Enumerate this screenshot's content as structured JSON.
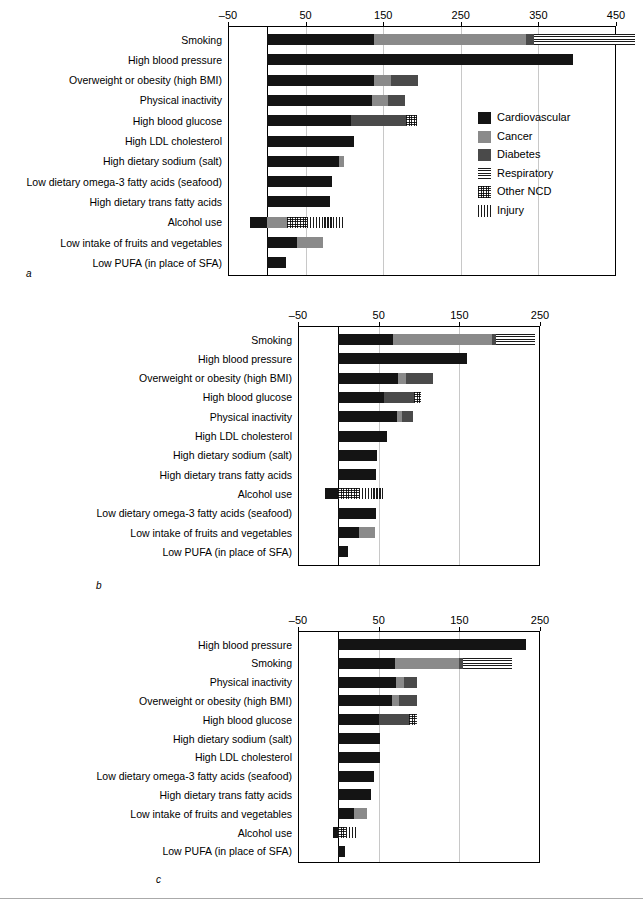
{
  "legend": {
    "items": [
      {
        "label": "Cardiovascular",
        "key": "cardio",
        "color": "#141414"
      },
      {
        "label": "Cancer",
        "key": "cancer",
        "color": "#8a8a8a"
      },
      {
        "label": "Diabetes",
        "key": "diabetes",
        "color": "#4a4a4a"
      },
      {
        "label": "Respiratory",
        "key": "respiratory",
        "color": "#1a1a1a"
      },
      {
        "label": "Other NCD",
        "key": "other_ncd",
        "color": "#2a2a2a"
      },
      {
        "label": "Injury",
        "key": "injury",
        "color": "#1a1a1a"
      }
    ]
  },
  "panels": [
    {
      "letter": "a"
    },
    {
      "letter": "b"
    },
    {
      "letter": "c"
    }
  ],
  "chart_data": [
    {
      "type": "bar",
      "orientation": "horizontal",
      "stacked": true,
      "panel": "a",
      "title": "",
      "xlabel": "",
      "ylabel": "",
      "xlim": [
        -50,
        450
      ],
      "xticks": [
        -50,
        50,
        150,
        250,
        350,
        450
      ],
      "xticklabels": [
        "–50",
        "50",
        "150",
        "250",
        "350",
        "450"
      ],
      "grid": "vertical",
      "legend_position": "inside-right",
      "series": [
        "Cardiovascular",
        "Cancer",
        "Diabetes",
        "Respiratory",
        "Other NCD",
        "Injury"
      ],
      "categories": [
        "Smoking",
        "High blood pressure",
        "Overweight or obesity (high BMI)",
        "Physical inactivity",
        "High blood glucose",
        "High LDL cholesterol",
        "High dietary sodium (salt)",
        "Low dietary omega-3 fatty acids (seafood)",
        "High dietary trans fatty acids",
        "Alcohol use",
        "Low intake of fruits and vegetables",
        "Low PUFA (in place of SFA)"
      ],
      "values": [
        {
          "cardio": 138,
          "cancer": 196,
          "diabetes": 10,
          "respiratory": 131,
          "other_ncd": 0,
          "injury": 0
        },
        {
          "cardio": 395,
          "cancer": 0,
          "diabetes": 0,
          "respiratory": 0,
          "other_ncd": 0,
          "injury": 0
        },
        {
          "cardio": 138,
          "cancer": 22,
          "diabetes": 35,
          "respiratory": 0,
          "other_ncd": 0,
          "injury": 0
        },
        {
          "cardio": 136,
          "cancer": 20,
          "diabetes": 22,
          "respiratory": 0,
          "other_ncd": 0,
          "injury": 0
        },
        {
          "cardio": 108,
          "cancer": 0,
          "diabetes": 72,
          "respiratory": 0,
          "other_ncd": 14,
          "injury": 0
        },
        {
          "cardio": 112,
          "cancer": 0,
          "diabetes": 0,
          "respiratory": 0,
          "other_ncd": 0,
          "injury": 0
        },
        {
          "cardio": 93,
          "cancer": 6,
          "diabetes": 0,
          "respiratory": 0,
          "other_ncd": 0,
          "injury": 0
        },
        {
          "cardio": 84,
          "cancer": 0,
          "diabetes": 0,
          "respiratory": 0,
          "other_ncd": 0,
          "injury": 0
        },
        {
          "cardio": 82,
          "cancer": 0,
          "diabetes": 0,
          "respiratory": 0,
          "other_ncd": 0,
          "injury": 0
        },
        {
          "cardio": -22,
          "cancer": 26,
          "diabetes": 0,
          "respiratory": 0,
          "other_ncd": 26,
          "injury": 48
        },
        {
          "cardio": 39,
          "cancer": 33,
          "diabetes": 0,
          "respiratory": 0,
          "other_ncd": 0,
          "injury": 0
        },
        {
          "cardio": 25,
          "cancer": 0,
          "diabetes": 0,
          "respiratory": 0,
          "other_ncd": 0,
          "injury": 0
        }
      ]
    },
    {
      "type": "bar",
      "orientation": "horizontal",
      "stacked": true,
      "panel": "b",
      "title": "",
      "xlabel": "",
      "ylabel": "",
      "xlim": [
        -50,
        250
      ],
      "xticks": [
        -50,
        50,
        150,
        250
      ],
      "xticklabels": [
        "–50",
        "50",
        "150",
        "250"
      ],
      "grid": "vertical",
      "legend_position": "none",
      "series": [
        "Cardiovascular",
        "Cancer",
        "Diabetes",
        "Respiratory",
        "Other NCD",
        "Injury"
      ],
      "categories": [
        "Smoking",
        "High blood pressure",
        "Overweight or obesity (high BMI)",
        "High blood glucose",
        "Physical inactivity",
        "High LDL cholesterol",
        "High dietary sodium (salt)",
        "High dietary trans fatty acids",
        "Alcohol use",
        "Low dietary omega-3 fatty acids (seafood)",
        "Low intake of fruits and vegetables",
        "Low PUFA (in place of SFA)"
      ],
      "values": [
        {
          "cardio": 68,
          "cancer": 122,
          "diabetes": 6,
          "respiratory": 48,
          "other_ncd": 0,
          "injury": 0
        },
        {
          "cardio": 160,
          "cancer": 0,
          "diabetes": 0,
          "respiratory": 0,
          "other_ncd": 0,
          "injury": 0
        },
        {
          "cardio": 74,
          "cancer": 10,
          "diabetes": 33,
          "respiratory": 0,
          "other_ncd": 0,
          "injury": 0
        },
        {
          "cardio": 57,
          "cancer": 0,
          "diabetes": 37,
          "respiratory": 0,
          "other_ncd": 8,
          "injury": 0
        },
        {
          "cardio": 73,
          "cancer": 6,
          "diabetes": 14,
          "respiratory": 0,
          "other_ncd": 0,
          "injury": 0
        },
        {
          "cardio": 60,
          "cancer": 0,
          "diabetes": 0,
          "respiratory": 0,
          "other_ncd": 0,
          "injury": 0
        },
        {
          "cardio": 48,
          "cancer": 0,
          "diabetes": 0,
          "respiratory": 0,
          "other_ncd": 0,
          "injury": 0
        },
        {
          "cardio": 47,
          "cancer": 0,
          "diabetes": 0,
          "respiratory": 0,
          "other_ncd": 0,
          "injury": 0
        },
        {
          "cardio": -16,
          "cancer": 0,
          "diabetes": 0,
          "respiratory": 0,
          "other_ncd": 26,
          "injury": 30
        },
        {
          "cardio": 47,
          "cancer": 0,
          "diabetes": 0,
          "respiratory": 0,
          "other_ncd": 0,
          "injury": 0
        },
        {
          "cardio": 26,
          "cancer": 19,
          "diabetes": 0,
          "respiratory": 0,
          "other_ncd": 0,
          "injury": 0
        },
        {
          "cardio": 12,
          "cancer": 0,
          "diabetes": 0,
          "respiratory": 0,
          "other_ncd": 0,
          "injury": 0
        }
      ]
    },
    {
      "type": "bar",
      "orientation": "horizontal",
      "stacked": true,
      "panel": "c",
      "title": "",
      "xlabel": "",
      "ylabel": "",
      "xlim": [
        -50,
        250
      ],
      "xticks": [
        -50,
        50,
        150,
        250
      ],
      "xticklabels": [
        "–50",
        "50",
        "150",
        "250"
      ],
      "grid": "vertical",
      "legend_position": "none",
      "series": [
        "Cardiovascular",
        "Cancer",
        "Diabetes",
        "Respiratory",
        "Other NCD",
        "Injury"
      ],
      "categories": [
        "High blood pressure",
        "Smoking",
        "Physical inactivity",
        "Overweight or obesity (high BMI)",
        "High blood glucose",
        "High dietary sodium (salt)",
        "High LDL cholesterol",
        "Low dietary omega-3 fatty acids (seafood)",
        "High dietary trans fatty acids",
        "Low intake of fruits and vegetables",
        "Alcohol use",
        "Low PUFA (in place of SFA)"
      ],
      "values": [
        {
          "cardio": 233,
          "cancer": 0,
          "diabetes": 0,
          "respiratory": 0,
          "other_ncd": 0,
          "injury": 0
        },
        {
          "cardio": 70,
          "cancer": 80,
          "diabetes": 5,
          "respiratory": 60,
          "other_ncd": 0,
          "injury": 0
        },
        {
          "cardio": 72,
          "cancer": 10,
          "diabetes": 16,
          "respiratory": 0,
          "other_ncd": 0,
          "injury": 0
        },
        {
          "cardio": 66,
          "cancer": 9,
          "diabetes": 23,
          "respiratory": 0,
          "other_ncd": 0,
          "injury": 0
        },
        {
          "cardio": 50,
          "cancer": 0,
          "diabetes": 38,
          "respiratory": 0,
          "other_ncd": 9,
          "injury": 0
        },
        {
          "cardio": 52,
          "cancer": 0,
          "diabetes": 0,
          "respiratory": 0,
          "other_ncd": 0,
          "injury": 0
        },
        {
          "cardio": 52,
          "cancer": 0,
          "diabetes": 0,
          "respiratory": 0,
          "other_ncd": 0,
          "injury": 0
        },
        {
          "cardio": 44,
          "cancer": 0,
          "diabetes": 0,
          "respiratory": 0,
          "other_ncd": 0,
          "injury": 0
        },
        {
          "cardio": 41,
          "cancer": 0,
          "diabetes": 0,
          "respiratory": 0,
          "other_ncd": 0,
          "injury": 0
        },
        {
          "cardio": 20,
          "cancer": 15,
          "diabetes": 0,
          "respiratory": 0,
          "other_ncd": 0,
          "injury": 0
        },
        {
          "cardio": -6,
          "cancer": 0,
          "diabetes": 0,
          "respiratory": 0,
          "other_ncd": 10,
          "injury": 14
        },
        {
          "cardio": 8,
          "cancer": 0,
          "diabetes": 0,
          "respiratory": 0,
          "other_ncd": 0,
          "injury": 0
        }
      ]
    }
  ]
}
